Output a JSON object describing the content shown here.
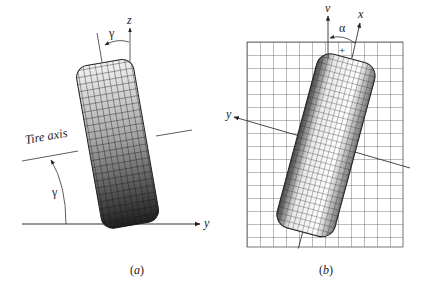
{
  "figure": {
    "panel_a": {
      "caption": "(a)",
      "caption_letter": "a",
      "labels": {
        "z_axis": "z",
        "y_axis": "y",
        "gamma_top": "γ",
        "gamma_left": "γ",
        "tire_axis": "Tire axis"
      },
      "description": "Tire tilted by camber angle γ relative to vertical z-axis; tire axis makes angle γ with ground y-axis"
    },
    "panel_b": {
      "caption": "(b)",
      "caption_letter": "b",
      "labels": {
        "v_axis": "v",
        "x_axis": "x",
        "y_axis": "y",
        "alpha": "α",
        "plus_sign": "+"
      },
      "description": "Top view of tire on grid ground plane rotated by slip angle α between velocity v and tire x-axis"
    },
    "colors": {
      "line": "#333333",
      "grid": "#555555",
      "tire_dark": "#1a1a1a",
      "tire_light": "#f4f4f4"
    }
  }
}
